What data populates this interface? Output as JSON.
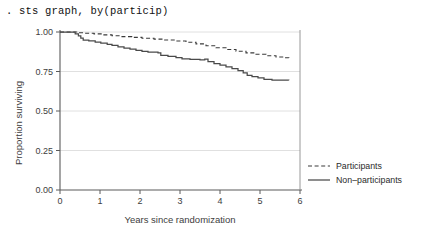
{
  "console": {
    "command": ". sts graph, by(particip)"
  },
  "chart_data": {
    "type": "line",
    "title": "",
    "xlabel": "Years since randomization",
    "ylabel": "Proportion surviving",
    "xlim": [
      0,
      6
    ],
    "ylim": [
      0,
      1
    ],
    "xticks": [
      "0",
      "1",
      "2",
      "3",
      "4",
      "5",
      "6"
    ],
    "xtick_values": [
      0,
      1,
      2,
      3,
      4,
      5,
      6
    ],
    "yticks": [
      "0.00",
      "0.25",
      "0.50",
      "0.75",
      "1.00"
    ],
    "ytick_values": [
      0,
      0.25,
      0.5,
      0.75,
      1.0
    ],
    "grid": "horizontal",
    "legend_position": "right",
    "series": [
      {
        "name": "Participants",
        "style": "dashed",
        "color": "#3a3a3a",
        "points": [
          [
            0.0,
            1.0
          ],
          [
            0.3,
            1.0
          ],
          [
            0.45,
            0.995
          ],
          [
            0.62,
            0.992
          ],
          [
            0.85,
            0.988
          ],
          [
            1.05,
            0.982
          ],
          [
            1.3,
            0.976
          ],
          [
            1.55,
            0.971
          ],
          [
            1.8,
            0.966
          ],
          [
            2.05,
            0.96
          ],
          [
            2.35,
            0.955
          ],
          [
            2.6,
            0.949
          ],
          [
            2.9,
            0.943
          ],
          [
            3.15,
            0.935
          ],
          [
            3.4,
            0.925
          ],
          [
            3.65,
            0.913
          ],
          [
            3.9,
            0.9
          ],
          [
            4.15,
            0.889
          ],
          [
            4.4,
            0.878
          ],
          [
            4.65,
            0.868
          ],
          [
            4.9,
            0.859
          ],
          [
            5.15,
            0.85
          ],
          [
            5.4,
            0.842
          ],
          [
            5.6,
            0.837
          ],
          [
            5.72,
            0.835
          ]
        ]
      },
      {
        "name": "Non-participants",
        "style": "solid",
        "color": "#4a4a4a",
        "points": [
          [
            0.0,
            1.0
          ],
          [
            0.32,
            1.0
          ],
          [
            0.38,
            0.988
          ],
          [
            0.46,
            0.975
          ],
          [
            0.52,
            0.962
          ],
          [
            0.58,
            0.948
          ],
          [
            0.72,
            0.944
          ],
          [
            0.88,
            0.936
          ],
          [
            1.02,
            0.93
          ],
          [
            1.18,
            0.922
          ],
          [
            1.3,
            0.916
          ],
          [
            1.45,
            0.906
          ],
          [
            1.6,
            0.898
          ],
          [
            1.75,
            0.892
          ],
          [
            1.9,
            0.884
          ],
          [
            2.05,
            0.878
          ],
          [
            2.2,
            0.872
          ],
          [
            2.45,
            0.868
          ],
          [
            2.52,
            0.852
          ],
          [
            2.7,
            0.846
          ],
          [
            2.9,
            0.838
          ],
          [
            3.05,
            0.83
          ],
          [
            3.25,
            0.826
          ],
          [
            3.5,
            0.824
          ],
          [
            3.62,
            0.828
          ],
          [
            3.7,
            0.812
          ],
          [
            3.85,
            0.8
          ],
          [
            4.0,
            0.79
          ],
          [
            4.15,
            0.78
          ],
          [
            4.3,
            0.768
          ],
          [
            4.45,
            0.755
          ],
          [
            4.58,
            0.742
          ],
          [
            4.68,
            0.726
          ],
          [
            4.8,
            0.718
          ],
          [
            4.95,
            0.71
          ],
          [
            5.1,
            0.7
          ],
          [
            5.3,
            0.696
          ],
          [
            5.5,
            0.696
          ],
          [
            5.72,
            0.695
          ]
        ]
      }
    ]
  }
}
